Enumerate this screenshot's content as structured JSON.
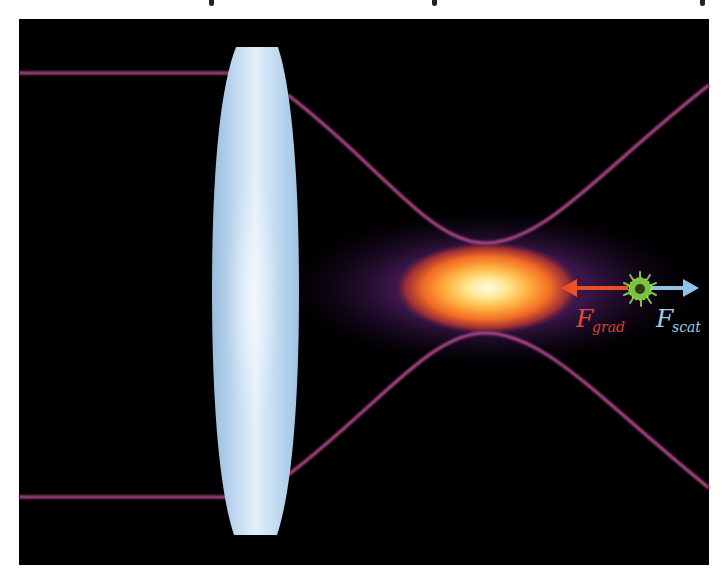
{
  "figure": {
    "background": "#000000",
    "page_background": "#ffffff",
    "panel": {
      "x": 19,
      "y": 19,
      "width": 690,
      "height": 546
    }
  },
  "lens": {
    "label": "objective lens",
    "fill": "#a9c9e9",
    "highlight": "#e8f4ff",
    "top_y": 47,
    "bottom_y": 535,
    "center_x": 255,
    "half_width": 44
  },
  "beam": {
    "color": "#b24a8c",
    "upper_input_y": 73,
    "lower_input_y": 497,
    "waist_x": 485,
    "waist_top_y": 243,
    "waist_bottom_y": 333,
    "exit_top_y": 85,
    "exit_bottom_y": 488
  },
  "focus_glow": {
    "center_x": 487,
    "center_y": 288,
    "colors": [
      "#fffbe0",
      "#ffd860",
      "#f47a28",
      "#d23c1e",
      "#5a1c5a",
      "#2a0e3a"
    ]
  },
  "particle": {
    "label": "trapped particle",
    "center_x": 640,
    "center_y": 289,
    "color": "#7cc23c",
    "core_color": "#2a3a18"
  },
  "forces": {
    "gradient": {
      "symbol": "F",
      "subscript": "grad",
      "color": "#e8502c",
      "arrow_from_x": 628,
      "arrow_to_x": 561,
      "y": 288
    },
    "scattering": {
      "symbol": "F",
      "subscript": "scat",
      "color": "#8fc4e6",
      "arrow_from_x": 652,
      "arrow_to_x": 698,
      "y": 288
    }
  }
}
